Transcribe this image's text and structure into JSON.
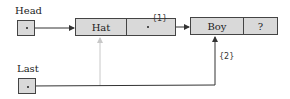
{
  "diagram": {
    "type": "linked-list-insertion",
    "head_label": "Head",
    "last_label": "Last",
    "nodes": [
      {
        "data": "Hat",
        "next": "•"
      },
      {
        "data": "Boy",
        "next": "?"
      }
    ],
    "annotations": {
      "step1": "{1}",
      "step2": "{2}"
    },
    "colors": {
      "box_fill": "#d9d9d9",
      "line": "#444444",
      "faded_line": "#c8c8c8"
    }
  }
}
